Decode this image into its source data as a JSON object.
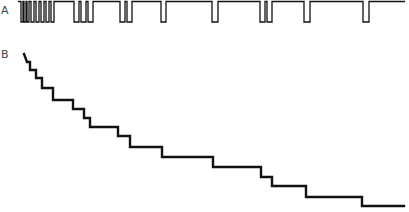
{
  "panels": {
    "a": {
      "label": "A",
      "trace_type": "spike-train",
      "baseline_y": 1.5,
      "pulse_bottom_y": 22,
      "x_start": 18,
      "x_end": 405,
      "pulses": [
        [
          21,
          23
        ],
        [
          24,
          26
        ],
        [
          27,
          29
        ],
        [
          31,
          34
        ],
        [
          36,
          39
        ],
        [
          41,
          44
        ],
        [
          46,
          49
        ],
        [
          51,
          54
        ],
        [
          74,
          79
        ],
        [
          81,
          86
        ],
        [
          88,
          93
        ],
        [
          120,
          125
        ],
        [
          127,
          132
        ],
        [
          161,
          166
        ],
        [
          212,
          218
        ],
        [
          260,
          265
        ],
        [
          267,
          272
        ],
        [
          304,
          310
        ],
        [
          363,
          369
        ]
      ]
    },
    "b": {
      "label": "B",
      "trace_type": "cumulative-staircase",
      "points": [
        [
          24,
          54
        ],
        [
          27,
          62
        ],
        [
          30,
          62
        ],
        [
          30,
          70
        ],
        [
          36,
          70
        ],
        [
          36,
          78
        ],
        [
          42,
          78
        ],
        [
          42,
          88
        ],
        [
          53,
          88
        ],
        [
          53,
          100
        ],
        [
          73,
          100
        ],
        [
          73,
          109
        ],
        [
          84,
          109
        ],
        [
          84,
          118
        ],
        [
          90,
          118
        ],
        [
          90,
          127
        ],
        [
          118,
          127
        ],
        [
          118,
          136
        ],
        [
          130,
          136
        ],
        [
          130,
          147
        ],
        [
          162,
          147
        ],
        [
          162,
          157
        ],
        [
          213,
          157
        ],
        [
          213,
          167
        ],
        [
          261,
          167
        ],
        [
          261,
          177
        ],
        [
          272,
          177
        ],
        [
          272,
          186
        ],
        [
          306,
          186
        ],
        [
          306,
          197
        ],
        [
          362,
          197
        ],
        [
          362,
          206
        ],
        [
          404,
          206
        ]
      ]
    }
  },
  "style": {
    "stroke_color": "#111111",
    "label_color": "#444444"
  }
}
